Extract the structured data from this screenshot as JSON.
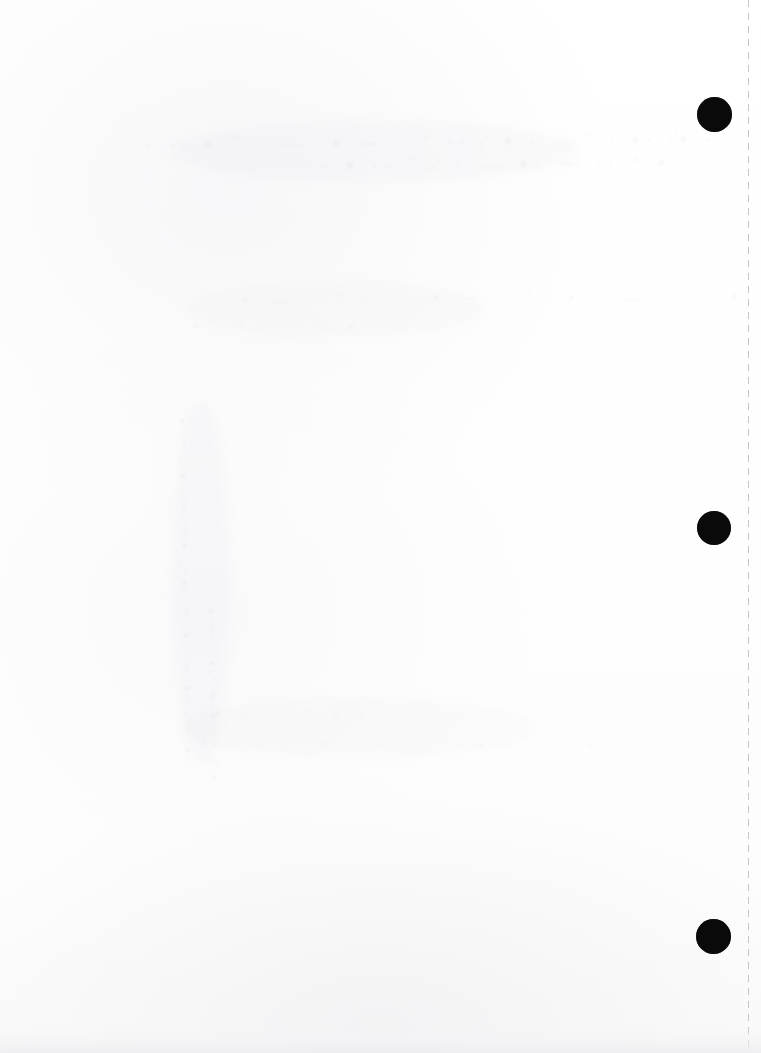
{
  "document": {
    "kind": "scanned-page",
    "page_label": "",
    "width_px": 761,
    "height_px": 1053,
    "background_color": "#fefefe",
    "content_summary": "Blank scanned sheet with three black registration marks and a dashed perforation line along the right margin"
  },
  "colors": {
    "paper": "#fefefe",
    "registration_mark": "#0a0a0a",
    "perforation_line": "#bcbcc0",
    "showthrough_ink": "#78788433",
    "bottom_shadow": "#ececef"
  },
  "perforation": {
    "name": "dashed-tear-line",
    "x_px": 748,
    "orientation": "vertical",
    "dash_length_px": 7,
    "gap_length_px": 6,
    "color": "#bcbcc0",
    "spans_full_height": true
  },
  "registration_marks": [
    {
      "label": "top-mark",
      "cx": 714,
      "cy": 114,
      "diameter": 35,
      "color": "#0a0a0a"
    },
    {
      "label": "middle-mark",
      "cx": 714,
      "cy": 528,
      "diameter": 34,
      "color": "#0a0a0a"
    },
    {
      "label": "bottom-mark",
      "cx": 713,
      "cy": 936,
      "diameter": 35,
      "color": "#0a0a0a"
    }
  ],
  "showthrough": {
    "note": "Faint, illegible ink bleed from the reverse side of the sheet; no legible text is present in the pixels.",
    "marks": [
      {
        "label": "upper-line",
        "text": "· ·· • ˜ · — ·• ∼ · ‘ ·· ⁄ • · —˜ · •· ⁄• ·",
        "x": 158,
        "y": 128,
        "class": "line-a"
      },
      {
        "label": "upper-line-2",
        "text": "· • ·· ˜ ⁄ · — •· ∼ ·· ‘ •",
        "x": 330,
        "y": 150,
        "class": "line-a"
      },
      {
        "label": "middle-band",
        "text": "·· • — · ˜ ⁄ ·· • ∼ · ‘· • · — ·· ⁄ •",
        "x": 200,
        "y": 288,
        "class": "line-b"
      },
      {
        "label": "middle-band-2",
        "text": "· • · ˜ ⁄ ·· — • · ∼",
        "x": 170,
        "y": 318,
        "class": "line-c"
      },
      {
        "label": "left-column",
        "text": "·•·—˜·⁄•·∼·‘•·—·⁄•·˜·•—·∼⁄·•·‘—·•·",
        "x": 176,
        "y": 402,
        "class": "vertical-col"
      },
      {
        "label": "left-column-2",
        "text": "·•·⁄˜·—•·∼·‘•·⁄·—•·˜·",
        "x": 202,
        "y": 430,
        "class": "vertical-col"
      },
      {
        "label": "lower-smudge",
        "text": "·· • — · ˜ ⁄· • ∼",
        "x": 184,
        "y": 706,
        "class": "smudge-row"
      },
      {
        "label": "lower-smudge-2",
        "text": "· •· ⁄ — · ˜ • ·· ∼ ‘",
        "x": 182,
        "y": 736,
        "class": "smudge-row"
      },
      {
        "label": "lower-smudge-3",
        "text": "·· • — · ⁄ ˜ •",
        "x": 448,
        "y": 738,
        "class": "smudge-row"
      }
    ]
  }
}
